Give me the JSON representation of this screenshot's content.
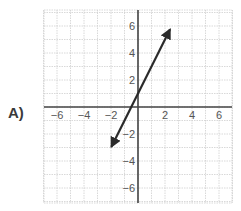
{
  "option": {
    "label": "A)"
  },
  "chart_data": {
    "type": "line",
    "title": "",
    "xlabel": "",
    "ylabel": "",
    "xlim": [
      -7,
      7
    ],
    "ylim": [
      -7,
      7
    ],
    "grid": true,
    "grid_step": 1,
    "x_ticks": [
      -6,
      -4,
      -2,
      2,
      4,
      6
    ],
    "y_ticks": [
      6,
      4,
      2,
      -2,
      -4,
      -6
    ],
    "x_tick_labels": [
      "−6",
      "−4",
      "−2",
      "2",
      "4",
      "6"
    ],
    "y_tick_labels": [
      "6",
      "4",
      "2",
      "−2",
      "−4",
      "−6"
    ],
    "series": [
      {
        "name": "y = 2x + 1",
        "equation": "y = 2x + 1",
        "slope": 2,
        "intercept": 1,
        "x": [
          -1.95,
          2.35
        ],
        "y": [
          -2.9,
          5.7
        ],
        "arrows": "both"
      }
    ],
    "colors": {
      "line": "#2b2b2b",
      "axis": "#444444",
      "grid": "#cfcfcf"
    }
  }
}
